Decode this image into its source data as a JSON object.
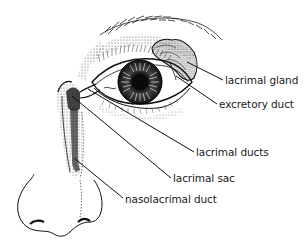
{
  "diagram": {
    "labels": [
      {
        "id": "lacrimal-gland",
        "text": "lacrimal gland",
        "x": 225,
        "y": 74
      },
      {
        "id": "excretory-duct",
        "text": "excretory duct",
        "x": 219,
        "y": 98
      },
      {
        "id": "lacrimal-ducts",
        "text": "lacrimal ducts",
        "x": 196,
        "y": 146
      },
      {
        "id": "lacrimal-sac",
        "text": "lacrimal sac",
        "x": 173,
        "y": 172
      },
      {
        "id": "nasolacrimal-duct",
        "text": "nasolacrimal duct",
        "x": 125,
        "y": 193
      }
    ],
    "colors": {
      "ink": "#1a1a1a",
      "background": "#ffffff"
    }
  }
}
